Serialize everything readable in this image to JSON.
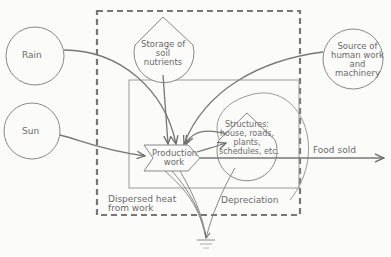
{
  "diagram": {
    "type": "energy-flow-diagram",
    "sources": [
      {
        "id": "rain",
        "label": "Rain"
      },
      {
        "id": "sun",
        "label": "Sun"
      },
      {
        "id": "human",
        "label_lines": [
          "Source of",
          "human work",
          "and",
          "machinery"
        ]
      }
    ],
    "storages": [
      {
        "id": "soil",
        "label_lines": [
          "Storage of",
          "soil",
          "nutrients"
        ]
      },
      {
        "id": "structures",
        "label_lines": [
          "Structures:",
          "house, roads,",
          "plants,",
          "schedules, etc."
        ]
      }
    ],
    "process": {
      "id": "production",
      "label_lines": [
        "Production",
        "work"
      ]
    },
    "outputs": {
      "food_sold": "Food sold",
      "dispersed_heat_lines": [
        "Dispersed heat",
        "from work"
      ],
      "depreciation": "Depreciation"
    },
    "colors": {
      "line": "#7a7a7a",
      "text": "#6a6a6a",
      "background": "#fbfbf9"
    }
  }
}
